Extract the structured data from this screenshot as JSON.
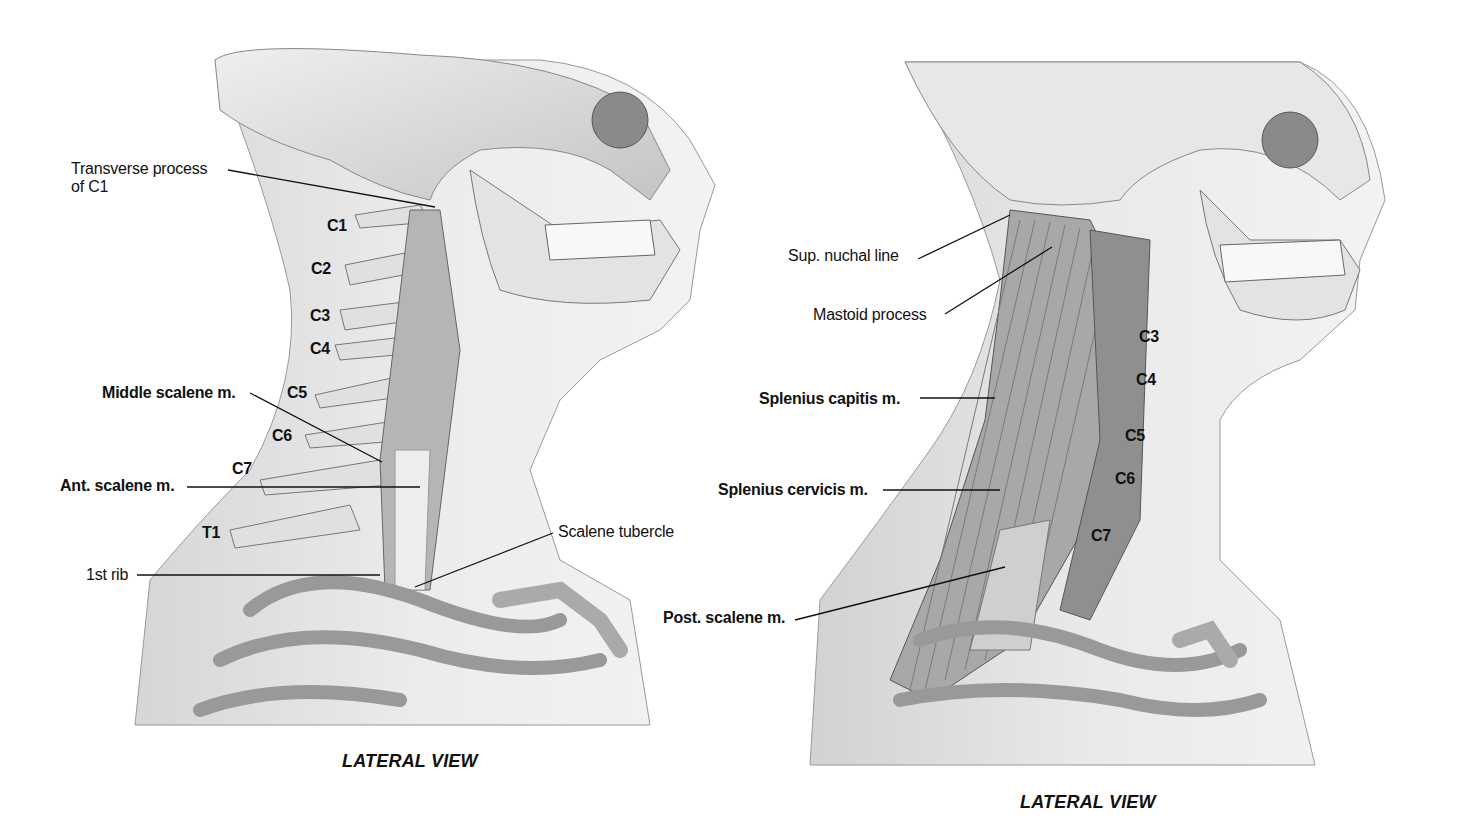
{
  "figure": {
    "left_panel": {
      "caption": "LATERAL VIEW",
      "labels": {
        "transverse_process_line1": "Transverse process",
        "transverse_process_line2": "of C1",
        "middle_scalene": "Middle scalene m.",
        "ant_scalene": "Ant. scalene m.",
        "first_rib": "1st rib",
        "scalene_tubercle": "Scalene tubercle"
      },
      "vertebrae": [
        "C1",
        "C2",
        "C3",
        "C4",
        "C5",
        "C6",
        "C7",
        "T1"
      ]
    },
    "right_panel": {
      "caption": "LATERAL VIEW",
      "labels": {
        "sup_nuchal_line": "Sup. nuchal line",
        "mastoid_process": "Mastoid process",
        "splenius_capitis": "Splenius capitis m.",
        "splenius_cervicis": "Splenius cervicis m.",
        "post_scalene": "Post. scalene m."
      },
      "vertebrae": [
        "C3",
        "C4",
        "C5",
        "C6",
        "C7"
      ]
    }
  }
}
